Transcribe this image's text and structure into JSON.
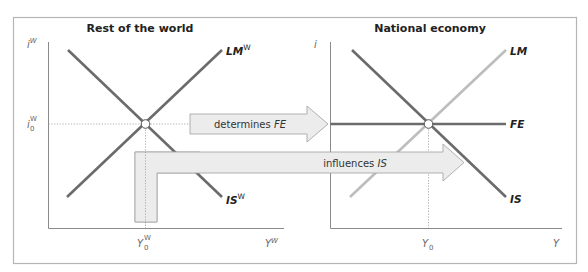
{
  "figure": {
    "panels": [
      {
        "title": "Rest of the world",
        "y_axis_label": "i",
        "y_axis_sup": "W",
        "y_equilibrium_label": "i",
        "y_equilibrium_sub": "0",
        "y_equilibrium_sup": "W",
        "x_axis_label": "Y",
        "x_axis_sup": "W",
        "x_equilibrium_label": "Y",
        "x_equilibrium_sub": "0",
        "x_equilibrium_sup": "W",
        "curves": [
          {
            "label": "LM",
            "sup": "W",
            "shade": "dark",
            "slope": "upward"
          },
          {
            "label": "IS",
            "sup": "W",
            "shade": "dark",
            "slope": "downward"
          }
        ]
      },
      {
        "title": "National economy",
        "y_axis_label": "i",
        "x_axis_label": "Y",
        "x_equilibrium_label": "Y",
        "x_equilibrium_sub": "0",
        "curves": [
          {
            "label": "LM",
            "shade": "light",
            "slope": "upward"
          },
          {
            "label": "FE",
            "shade": "dark",
            "slope": "horizontal"
          },
          {
            "label": "IS",
            "shade": "dark",
            "slope": "downward"
          }
        ]
      }
    ],
    "arrows": [
      {
        "text_prefix": "determines ",
        "text_italic": "FE"
      },
      {
        "text_prefix": "influences ",
        "text_italic": "IS"
      }
    ],
    "colors": {
      "frame": "#b5b5b5",
      "axis": "#8a8a8a",
      "dark_curve": "#6b6b6b",
      "light_curve": "#bdbdbd",
      "arrow_fill": "#ececec",
      "arrow_stroke": "#a8a8a8",
      "text": "#222222",
      "guide": "#9a9a9a"
    }
  }
}
